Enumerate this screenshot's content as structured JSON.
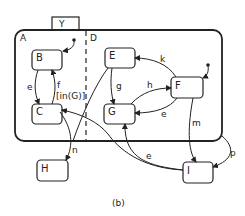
{
  "diagram": {
    "caption": "(b)",
    "colors": {
      "stroke": "#222222",
      "background": "#ffffff"
    },
    "superstate": {
      "tab_label": "Y",
      "label": "A",
      "orthogonal_label": "D"
    },
    "states": {
      "B": "B",
      "C": "C",
      "E": "E",
      "F": "F",
      "G": "G",
      "H": "H",
      "I": "I"
    },
    "transitions": {
      "B_to_C": "e",
      "C_to_B": "f",
      "C_to_B_guard": "[in(G)]",
      "E_to_G": "g",
      "G_to_F": "h",
      "F_to_E": "k",
      "F_to_G": "e",
      "F_to_I": "m",
      "A_to_I": "p",
      "C_to_H": "n",
      "I_to_G": "e"
    }
  }
}
